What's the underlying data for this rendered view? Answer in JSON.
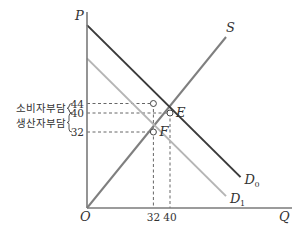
{
  "chart_data": {
    "type": "line",
    "title": "",
    "xlabel": "Q",
    "ylabel": "P",
    "origin_label": "O",
    "xlim": [
      0,
      140
    ],
    "ylim": [
      0,
      78
    ],
    "series": [
      {
        "name": "S",
        "label": "S",
        "color": "#7f7f7f",
        "points": [
          [
            0,
            0
          ],
          [
            67,
            72
          ]
        ]
      },
      {
        "name": "D0",
        "label": "D",
        "subscript": "0",
        "color": "#3a3a3a",
        "points": [
          [
            0,
            77
          ],
          [
            74,
            13
          ]
        ]
      },
      {
        "name": "D1",
        "label": "D",
        "subscript": "1",
        "color": "#b5b5b5",
        "points": [
          [
            0,
            63
          ],
          [
            67,
            5
          ]
        ]
      }
    ],
    "points": [
      {
        "name": "E",
        "label": "E",
        "x": 40,
        "y": 40
      },
      {
        "name": "F",
        "label": "F",
        "x": 32,
        "y": 32
      },
      {
        "name": "consumer-price",
        "label": "",
        "x": 32,
        "y": 44
      }
    ],
    "y_ticks": [
      44,
      40,
      32
    ],
    "x_ticks": [
      32,
      40
    ],
    "annotations": [
      {
        "text": "소비자부담",
        "range": [
          40,
          44
        ]
      },
      {
        "text": "생산자부담",
        "range": [
          32,
          40
        ]
      }
    ],
    "grid": false,
    "legend": "none"
  }
}
